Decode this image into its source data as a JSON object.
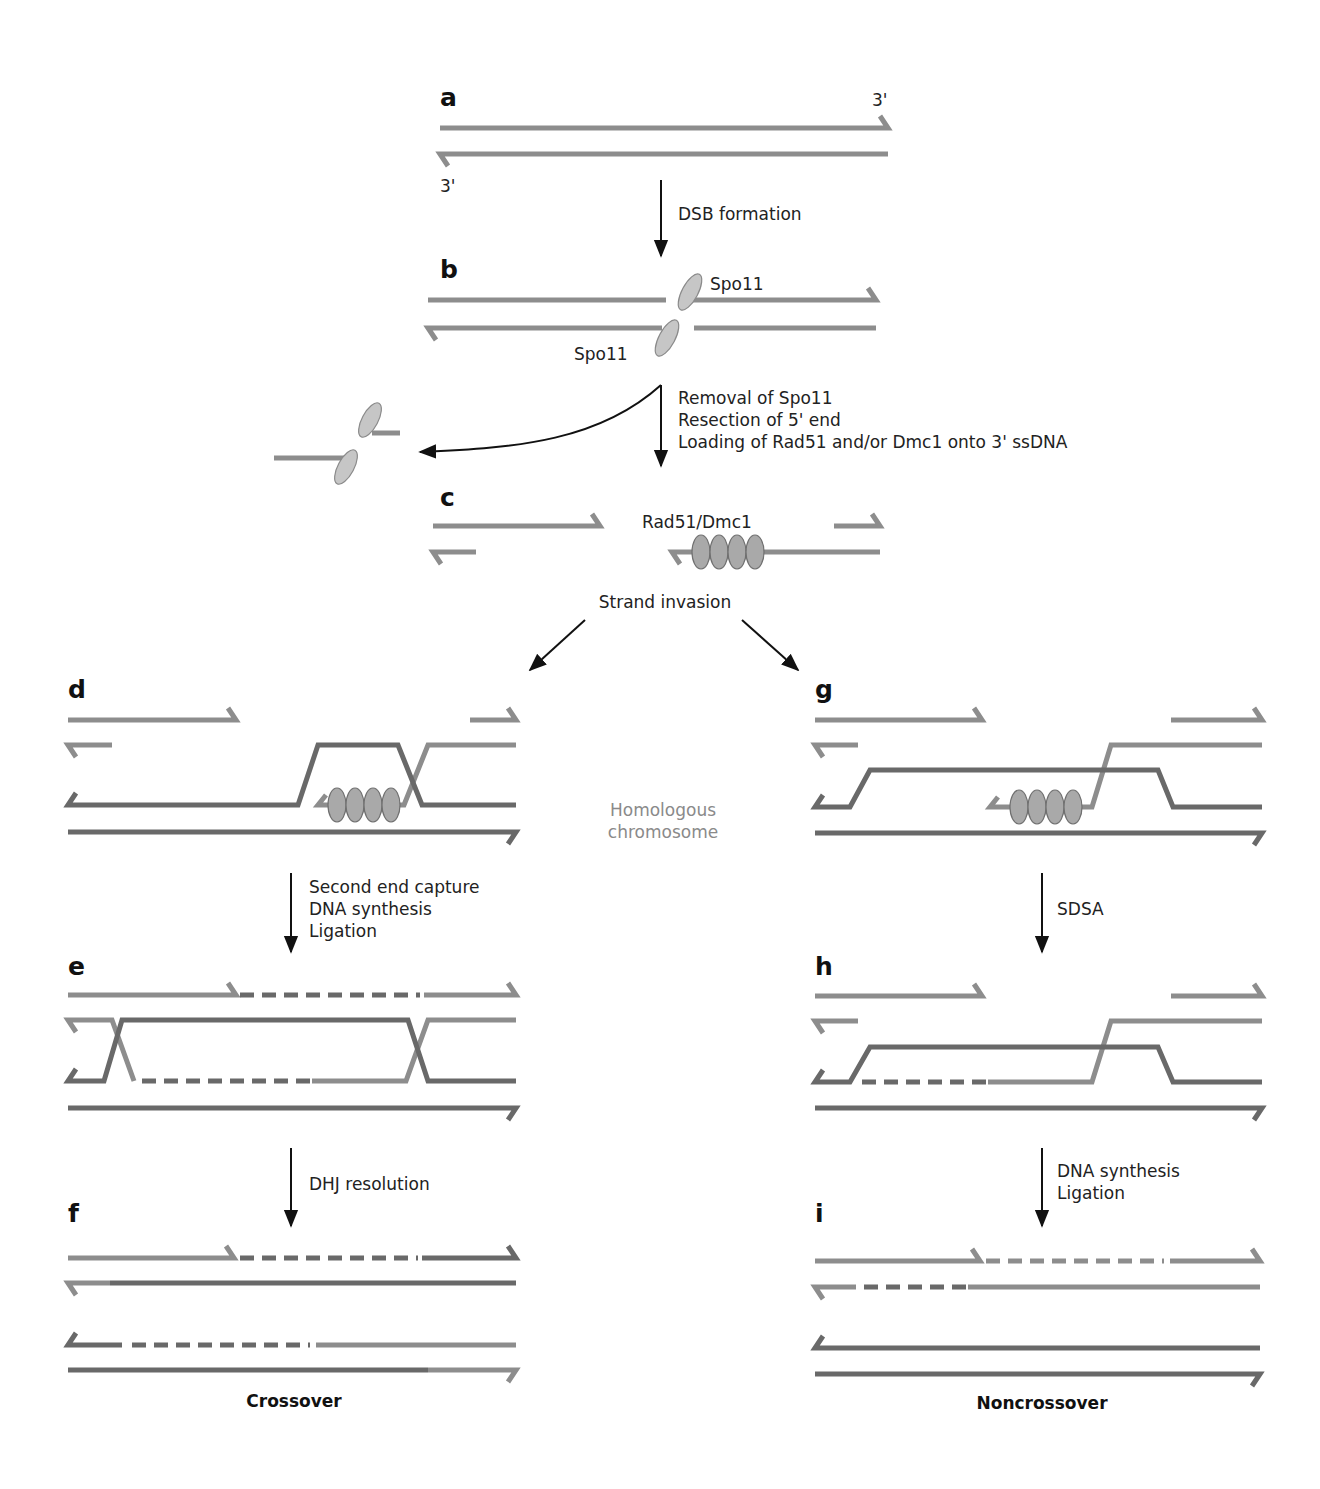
{
  "figure": {
    "colors": {
      "strand_light": "#8d8d8d",
      "strand_dark": "#696969",
      "protein": "#c6c6c6",
      "rad51": "#a9a9a9",
      "text": "#222222",
      "muted_text": "#8a8a8a"
    }
  },
  "panels": {
    "a": {
      "letter": "a",
      "end_label_top": "3'",
      "end_label_bottom": "3'"
    },
    "b": {
      "letter": "b",
      "protein_top": "Spo11",
      "protein_bottom": "Spo11"
    },
    "c": {
      "letter": "c",
      "filament_label": "Rad51/Dmc1"
    },
    "d": {
      "letter": "d"
    },
    "e": {
      "letter": "e"
    },
    "f": {
      "letter": "f"
    },
    "g": {
      "letter": "g"
    },
    "h": {
      "letter": "h"
    },
    "i": {
      "letter": "i"
    }
  },
  "steps": {
    "a_to_b": [
      "DSB formation"
    ],
    "b_to_c": [
      "Removal of Spo11",
      "Resection of 5' end",
      "Loading of Rad51 and/or Dmc1 onto 3' ssDNA"
    ],
    "c_split": "Strand invasion",
    "d_to_e": [
      "Second end capture",
      "DNA synthesis",
      "Ligation"
    ],
    "e_to_f": [
      "DHJ resolution"
    ],
    "g_to_h": [
      "SDSA"
    ],
    "h_to_i": [
      "DNA synthesis",
      "Ligation"
    ]
  },
  "annotations": {
    "homolog": [
      "Homologous",
      "chromosome"
    ]
  },
  "outcomes": {
    "left": "Crossover",
    "right": "Noncrossover"
  }
}
